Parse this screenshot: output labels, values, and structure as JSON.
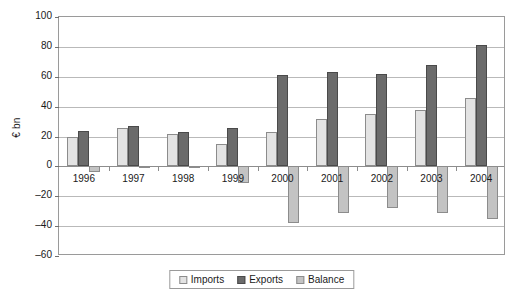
{
  "chart_data": {
    "type": "bar",
    "title": "",
    "subtitle": "",
    "xlabel": "",
    "ylabel": "€ bn",
    "categories": [
      "1996",
      "1997",
      "1998",
      "1999",
      "2000",
      "2001",
      "2002",
      "2003",
      "2004"
    ],
    "series": [
      {
        "name": "Imports",
        "color": "#e3e3e3",
        "values": [
          20,
          26,
          22,
          15,
          23,
          32,
          35,
          38,
          46
        ]
      },
      {
        "name": "Exports",
        "color": "#6b6b6b",
        "values": [
          24,
          27,
          23,
          26,
          61,
          63,
          62,
          68,
          81
        ]
      },
      {
        "name": "Balance",
        "color": "#c3c3c3",
        "values": [
          -4,
          -1,
          -1,
          -11,
          -38,
          -31,
          -28,
          -31,
          -35
        ]
      }
    ],
    "ylim": [
      -60,
      100
    ],
    "ytick_labels": [
      "100",
      "80",
      "60",
      "40",
      "20",
      "0",
      "–20",
      "–40",
      "–60"
    ],
    "ytick_values": [
      100,
      80,
      60,
      40,
      20,
      0,
      -20,
      -40,
      -60
    ],
    "grid": true,
    "legend_position": "bottom-center",
    "legend_entries": [
      "Imports",
      "Exports",
      "Balance"
    ]
  }
}
